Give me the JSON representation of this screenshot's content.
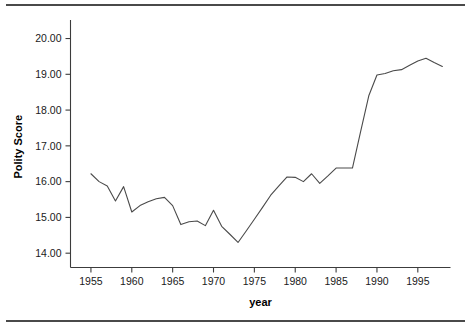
{
  "figure": {
    "background": "#ffffff",
    "rule_color": "#4a4a4a",
    "axis_color": "#3c3c3c"
  },
  "chart_data": {
    "type": "line",
    "title": "",
    "xlabel": "year",
    "ylabel": "Polity Score",
    "xlim": [
      1952.5,
      1999.0
    ],
    "ylim": [
      13.6,
      20.35
    ],
    "grid": false,
    "legend": null,
    "line_color": "#4a4a4a",
    "x_ticks": [
      1955,
      1960,
      1965,
      1970,
      1975,
      1980,
      1985,
      1990,
      1995
    ],
    "x_tick_labels": [
      "1955",
      "1960",
      "1965",
      "1970",
      "1975",
      "1980",
      "1985",
      "1990",
      "1995"
    ],
    "y_ticks": [
      14,
      15,
      16,
      17,
      18,
      19,
      20
    ],
    "y_tick_labels": [
      "14.00",
      "15.00",
      "16.00",
      "17.00",
      "18.00",
      "19.00",
      "20.00"
    ],
    "series": [
      {
        "name": "Polity Score",
        "x": [
          1955,
          1956,
          1957,
          1958,
          1959,
          1960,
          1961,
          1962,
          1963,
          1964,
          1965,
          1966,
          1967,
          1968,
          1969,
          1970,
          1971,
          1972,
          1973,
          1974,
          1975,
          1976,
          1977,
          1978,
          1979,
          1980,
          1981,
          1982,
          1983,
          1984,
          1985,
          1986,
          1987,
          1988,
          1989,
          1990,
          1991,
          1992,
          1993,
          1994,
          1995,
          1996,
          1997,
          1998
        ],
        "values": [
          16.22,
          16.0,
          15.88,
          15.46,
          15.86,
          15.15,
          15.33,
          15.44,
          15.52,
          15.56,
          15.33,
          14.8,
          14.88,
          14.9,
          14.77,
          15.2,
          14.75,
          14.53,
          14.3,
          14.62,
          14.95,
          15.28,
          15.62,
          15.88,
          16.13,
          16.12,
          16.0,
          16.22,
          15.95,
          16.16,
          16.38,
          16.38,
          16.38,
          17.4,
          18.4,
          18.98,
          19.02,
          19.1,
          19.13,
          19.25,
          19.37,
          19.45,
          19.33,
          19.22
        ]
      }
    ]
  }
}
